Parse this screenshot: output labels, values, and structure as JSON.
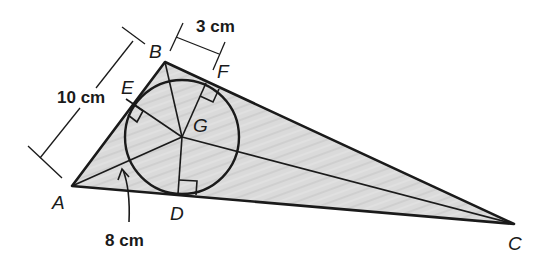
{
  "diagram": {
    "type": "triangle-incircle",
    "fill_color": "#d9d9d9",
    "stroke_color": "#1a1a1a",
    "vertices": {
      "A": {
        "label": "A"
      },
      "B": {
        "label": "B"
      },
      "C": {
        "label": "C"
      }
    },
    "points": {
      "D": {
        "label": "D"
      },
      "E": {
        "label": "E"
      },
      "F": {
        "label": "F"
      },
      "G": {
        "label": "G"
      }
    },
    "measurements": {
      "AB": "10 cm",
      "BF": "3 cm",
      "AG": "8 cm"
    }
  }
}
